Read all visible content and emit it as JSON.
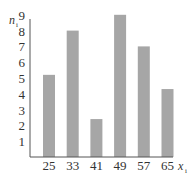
{
  "chart_data": {
    "type": "bar",
    "title": "",
    "xlabel": "x_i",
    "ylabel": "n_i",
    "categories": [
      "25",
      "33",
      "41",
      "49",
      "57",
      "65"
    ],
    "values": [
      5.2,
      8,
      2.4,
      9,
      7,
      4.3
    ],
    "yticks": [
      1,
      2,
      3,
      4,
      5,
      6,
      7,
      8,
      9
    ],
    "ylim": [
      0,
      9
    ],
    "grid": false,
    "legend": null,
    "bar_color": "#a6a6a6"
  },
  "labels": {
    "y_axis": "n",
    "y_sub": "i",
    "x_axis": "x",
    "x_sub": "i"
  }
}
